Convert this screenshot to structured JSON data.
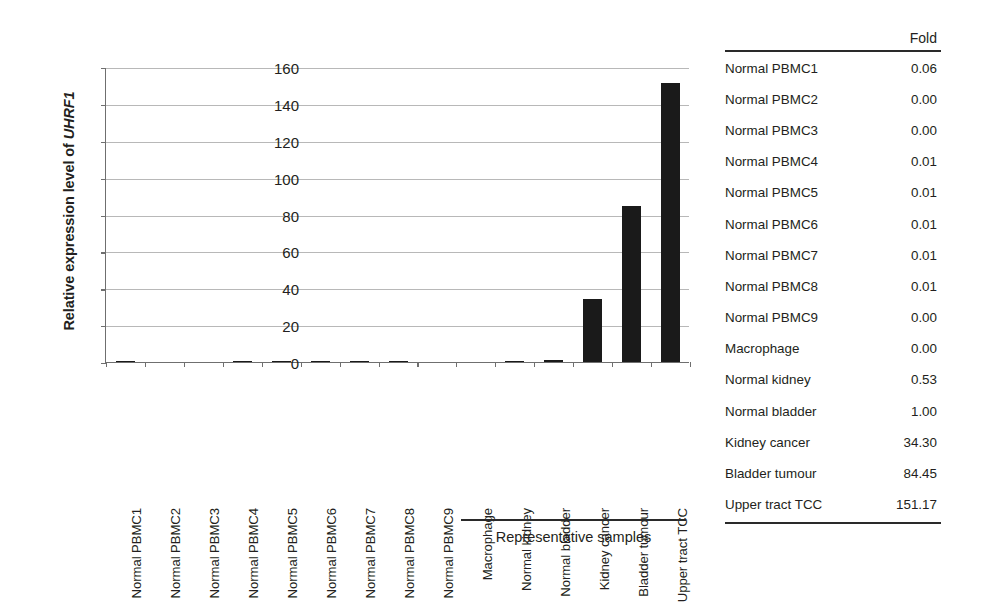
{
  "chart_data": {
    "type": "bar",
    "title": "",
    "xlabel": "Representative samples",
    "ylabel": "Relative expression level of UHRF1",
    "ylabel_plain": "Relative expression level of ",
    "ylabel_gene": "UHRF1",
    "ylim": [
      0,
      160
    ],
    "ytick_step": 20,
    "yticks": [
      160,
      140,
      120,
      100,
      80,
      60,
      40,
      20,
      0
    ],
    "grid": true,
    "legend": "none",
    "bar_color": "#1a1a1a",
    "categories": [
      "Normal PBMC1",
      "Normal PBMC2",
      "Normal PBMC3",
      "Normal PBMC4",
      "Normal PBMC5",
      "Normal PBMC6",
      "Normal PBMC7",
      "Normal PBMC8",
      "Normal PBMC9",
      "Macrophage",
      "Normal kidney",
      "Normal bladder",
      "Kidney cancer",
      "Bladder tumour",
      "Upper tract TCC"
    ],
    "values": [
      0.06,
      0.0,
      0.0,
      0.01,
      0.01,
      0.01,
      0.01,
      0.01,
      0.0,
      0.0,
      0.53,
      1.0,
      34.3,
      84.45,
      151.17
    ]
  },
  "axis": {
    "y_title_prefix": "Relative expression level of ",
    "y_title_gene": "UHRF1",
    "tick_labels": [
      "160",
      "140",
      "120",
      "100",
      "80",
      "60",
      "40",
      "20",
      "0"
    ]
  },
  "bracket": {
    "caption": "Representative samples"
  },
  "table": {
    "header_label": "",
    "header_value": "Fold",
    "rows": [
      {
        "name": "Normal PBMC1",
        "value": "0.06"
      },
      {
        "name": "Normal PBMC2",
        "value": "0.00"
      },
      {
        "name": "Normal PBMC3",
        "value": "0.00"
      },
      {
        "name": "Normal PBMC4",
        "value": "0.01"
      },
      {
        "name": "Normal PBMC5",
        "value": "0.01"
      },
      {
        "name": "Normal PBMC6",
        "value": "0.01"
      },
      {
        "name": "Normal PBMC7",
        "value": "0.01"
      },
      {
        "name": "Normal PBMC8",
        "value": "0.01"
      },
      {
        "name": "Normal PBMC9",
        "value": "0.00"
      },
      {
        "name": "Macrophage",
        "value": "0.00"
      },
      {
        "name": "Normal kidney",
        "value": "0.53"
      },
      {
        "name": "Normal bladder",
        "value": "1.00"
      },
      {
        "name": "Kidney cancer",
        "value": "34.30"
      },
      {
        "name": "Bladder tumour",
        "value": "84.45"
      },
      {
        "name": "Upper tract TCC",
        "value": "151.17"
      }
    ]
  }
}
